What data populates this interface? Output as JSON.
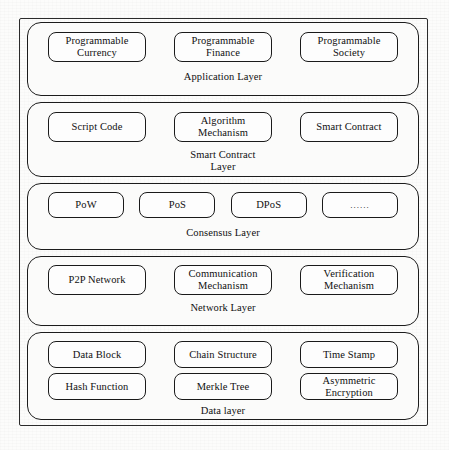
{
  "diagram": {
    "type": "layered-stack-diagram",
    "frame_color": "#2b2b2b",
    "box_border_color": "#1a1a1a",
    "background_color": "#fcfcfb",
    "text_color": "#101010",
    "layers": [
      {
        "id": "application",
        "title": "Application Layer",
        "rows": [
          [
            "Programmable Currency",
            "Programmable Finance",
            "Programmable Society"
          ]
        ]
      },
      {
        "id": "smart-contract",
        "title": "Smart Contract Layer",
        "title_line_1": "Smart Contract",
        "title_line_2": "Layer",
        "rows": [
          [
            "Script Code",
            "Algorithm Mechanism",
            "Smart Contract"
          ]
        ]
      },
      {
        "id": "consensus",
        "title": "Consensus Layer",
        "rows": [
          [
            "PoW",
            "PoS",
            "DPoS",
            "......"
          ]
        ]
      },
      {
        "id": "network",
        "title": "Network Layer",
        "rows": [
          [
            "P2P Network",
            "Communication Mechanism",
            "Verification Mechanism"
          ]
        ]
      },
      {
        "id": "data",
        "title": "Data layer",
        "rows": [
          [
            "Data Block",
            "Chain Structure",
            "Time Stamp"
          ],
          [
            "Hash Function",
            "Merkle Tree",
            "Asymmetric Encryption"
          ]
        ]
      }
    ]
  },
  "application": {
    "title": "Application Layer",
    "item_0": "Programmable Currency",
    "item_1": "Programmable Finance",
    "item_2": "Programmable Society"
  },
  "smart_contract": {
    "title_line_1": "Smart Contract",
    "title_line_2": "Layer",
    "item_0": "Script Code",
    "item_1": "Algorithm Mechanism",
    "item_2": "Smart Contract"
  },
  "consensus": {
    "title": "Consensus Layer",
    "item_0": "PoW",
    "item_1": "PoS",
    "item_2": "DPoS",
    "item_3": "......"
  },
  "network": {
    "title": "Network Layer",
    "item_0": "P2P Network",
    "item_1": "Communication Mechanism",
    "item_2": "Verification Mechanism"
  },
  "data_layer": {
    "title": "Data layer",
    "item_0": "Data Block",
    "item_1": "Chain Structure",
    "item_2": "Time Stamp",
    "item_3": "Hash Function",
    "item_4": "Merkle Tree",
    "item_5": "Asymmetric Encryption"
  }
}
